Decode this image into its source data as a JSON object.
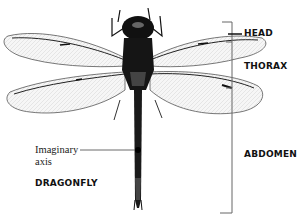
{
  "diagram": {
    "title": "DRAGONFLY",
    "axis_label_line1": "Imaginary",
    "axis_label_line2": "axis",
    "body_parts": [
      {
        "label": "HEAD"
      },
      {
        "label": "THORAX"
      },
      {
        "label": "ABDOMEN"
      }
    ],
    "colors": {
      "background": "#ffffff",
      "ink": "#111111",
      "wing": "#f2f2f2",
      "bracket": "#666666"
    }
  }
}
